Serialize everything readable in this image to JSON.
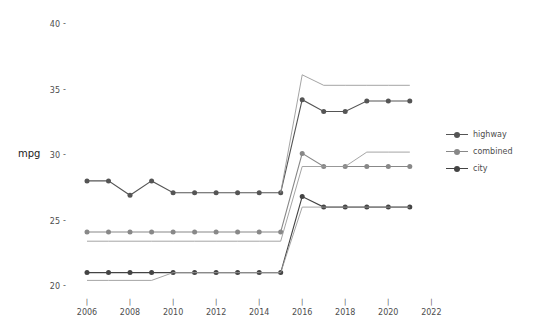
{
  "chart_data": {
    "type": "line",
    "title": "",
    "xlabel": "",
    "ylabel": "mpg",
    "xlim": [
      2005.2,
      2022.8
    ],
    "ylim": [
      19.4,
      40.6
    ],
    "xticks": [
      2006,
      2008,
      2010,
      2012,
      2014,
      2016,
      2018,
      2020,
      2022
    ],
    "yticks": [
      20,
      25,
      30,
      35,
      40
    ],
    "grid": false,
    "legend_position": "right",
    "x": [
      2006,
      2007,
      2008,
      2009,
      2010,
      2011,
      2012,
      2013,
      2014,
      2015,
      2016,
      2017,
      2018,
      2019,
      2020,
      2021
    ],
    "series": [
      {
        "name": "highway",
        "color": "#555555",
        "markers": true,
        "values": [
          28.1,
          28.1,
          27.0,
          28.1,
          27.2,
          27.2,
          27.2,
          27.2,
          27.2,
          27.2,
          34.3,
          33.4,
          33.4,
          34.2,
          34.2,
          34.2
        ]
      },
      {
        "name": "combined",
        "color": "#888888",
        "markers": true,
        "values": [
          24.2,
          24.2,
          24.2,
          24.2,
          24.2,
          24.2,
          24.2,
          24.2,
          24.2,
          24.2,
          30.2,
          29.2,
          29.2,
          29.2,
          29.2,
          29.2
        ]
      },
      {
        "name": "city",
        "color": "#444444",
        "markers": true,
        "values": [
          21.1,
          21.1,
          21.1,
          21.1,
          21.1,
          21.1,
          21.1,
          21.1,
          21.1,
          21.1,
          26.9,
          26.1,
          26.1,
          26.1,
          26.1,
          26.1
        ]
      },
      {
        "name": "highway-reference",
        "color": "#9a9a9a",
        "markers": false,
        "values": [
          null,
          null,
          null,
          null,
          null,
          null,
          null,
          null,
          null,
          27.2,
          36.2,
          35.4,
          35.4,
          35.4,
          35.4,
          35.4
        ]
      },
      {
        "name": "combined-reference",
        "color": "#9a9a9a",
        "markers": false,
        "values": [
          23.5,
          23.5,
          23.5,
          23.5,
          23.5,
          23.5,
          23.5,
          23.5,
          23.5,
          23.5,
          29.2,
          29.2,
          29.2,
          30.3,
          30.3,
          30.3
        ]
      },
      {
        "name": "city-reference",
        "color": "#9a9a9a",
        "markers": false,
        "values": [
          20.5,
          20.5,
          20.5,
          20.5,
          21.1,
          21.1,
          21.1,
          21.1,
          21.1,
          21.1,
          26.1,
          26.1,
          26.1,
          26.1,
          26.1,
          26.1
        ]
      }
    ],
    "legend": [
      "highway",
      "combined",
      "city"
    ]
  },
  "axes": {
    "y_title": "mpg"
  }
}
